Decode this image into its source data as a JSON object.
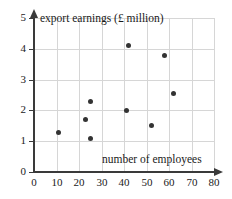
{
  "chart_data": {
    "type": "scatter",
    "title": "",
    "xlabel": "number of employees",
    "ylabel": "export earnings (£ million)",
    "xlim": [
      0,
      80
    ],
    "ylim": [
      0,
      5
    ],
    "xticks": [
      0,
      10,
      20,
      30,
      40,
      50,
      60,
      70,
      80
    ],
    "yticks": [
      0,
      1,
      2,
      3,
      4,
      5
    ],
    "xtick_labels": [
      "0",
      "10",
      "20",
      "30",
      "40",
      "50",
      "60",
      "70",
      "80"
    ],
    "ytick_labels": [
      "0",
      "1",
      "2",
      "3",
      "4",
      "5"
    ],
    "grid": true,
    "legend": null,
    "points": [
      {
        "x": 11,
        "y": 1.3
      },
      {
        "x": 23,
        "y": 1.7
      },
      {
        "x": 25,
        "y": 2.3
      },
      {
        "x": 25,
        "y": 1.1
      },
      {
        "x": 41,
        "y": 2.0
      },
      {
        "x": 42,
        "y": 4.1
      },
      {
        "x": 52,
        "y": 1.5
      },
      {
        "x": 58,
        "y": 3.8
      },
      {
        "x": 62,
        "y": 2.55
      }
    ],
    "marker": {
      "shape": "filled-circle",
      "color": "#333333",
      "size_px": 5
    },
    "colors": {
      "axis": "#3a3a3a",
      "grid": "#d6d6d6",
      "background": "#ffffff",
      "text": "#1a1a1a"
    }
  }
}
